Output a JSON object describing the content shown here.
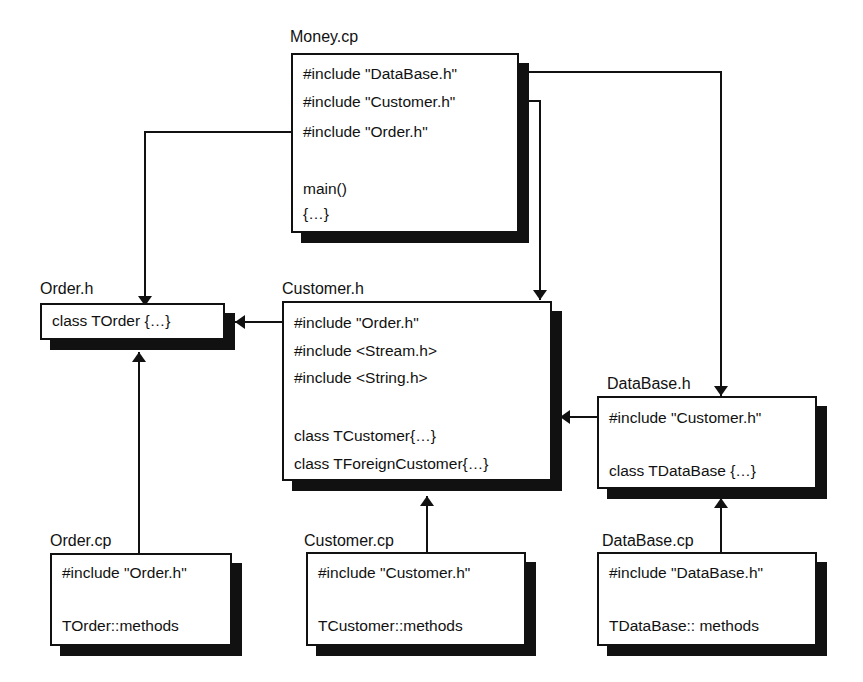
{
  "files": {
    "money_cp": {
      "title": "Money.cp",
      "lines": [
        "#include \"DataBase.h\"",
        "#include \"Customer.h\"",
        "#include \"Order.h\"",
        "main()",
        "{…}"
      ]
    },
    "order_h": {
      "title": "Order.h",
      "lines": [
        "class TOrder {…}"
      ]
    },
    "customer_h": {
      "title": "Customer.h",
      "lines": [
        "#include \"Order.h\"",
        "#include <Stream.h>",
        "#include <String.h>",
        "class TCustomer{…}",
        "class TForeignCustomer{…}"
      ]
    },
    "database_h": {
      "title": "DataBase.h",
      "lines": [
        "#include \"Customer.h\"",
        "class TDataBase {…}"
      ]
    },
    "order_cp": {
      "title": "Order.cp",
      "lines": [
        "#include \"Order.h\"",
        "TOrder::methods"
      ]
    },
    "customer_cp": {
      "title": "Customer.cp",
      "lines": [
        "#include \"Customer.h\"",
        "TCustomer::methods"
      ]
    },
    "database_cp": {
      "title": "DataBase.cp",
      "lines": [
        "#include \"DataBase.h\"",
        "TDataBase:: methods"
      ]
    }
  },
  "dependencies": [
    {
      "from": "Money.cp",
      "to": "DataBase.h"
    },
    {
      "from": "Money.cp",
      "to": "Customer.h"
    },
    {
      "from": "Money.cp",
      "to": "Order.h"
    },
    {
      "from": "Customer.h",
      "to": "Order.h"
    },
    {
      "from": "DataBase.h",
      "to": "Customer.h"
    },
    {
      "from": "Order.cp",
      "to": "Order.h"
    },
    {
      "from": "Customer.cp",
      "to": "Customer.h"
    },
    {
      "from": "DataBase.cp",
      "to": "DataBase.h"
    }
  ]
}
